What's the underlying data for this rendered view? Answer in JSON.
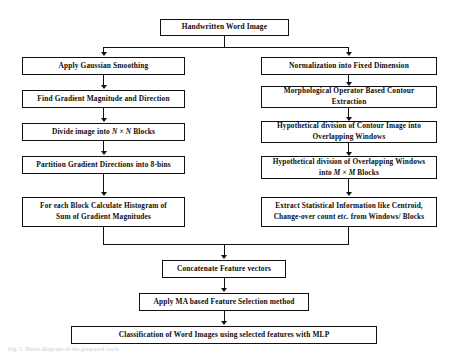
{
  "diagram": {
    "style": {
      "background": "#ffffff",
      "box_border": "#111111",
      "box_fill": "#ffffff",
      "text_color": "#0d0d0d",
      "connector_color": "#111111"
    },
    "nodes": {
      "root": "Handwritten Word Image",
      "left": [
        "Apply Gaussian Smoothing",
        "Find Gradient Magnitude and Direction",
        "Divide image into N × N Blocks",
        "Partition Gradient Directions into 8-bins",
        "For each Block Calculate Histogram of\nSum of Gradient Magnitudes"
      ],
      "right": [
        "Normalization into Fixed Dimension",
        "Morphological Operator Based Contour\nExtraction",
        "Hypothetical division of Contour Image into\nOverlapping Windows",
        "Hypothetical division of Overlapping Windows\ninto M × M Blocks",
        "Extract Statistical Information like Centroid,\nChange-over count etc. from Windows/ Blocks"
      ],
      "merge": [
        "Concatenate Feature vectors",
        "Apply MA based Feature Selection method",
        "Classification of Word Images using selected features with MLP"
      ]
    },
    "caption": "Fig. 1. Block diagram of the proposed work"
  }
}
